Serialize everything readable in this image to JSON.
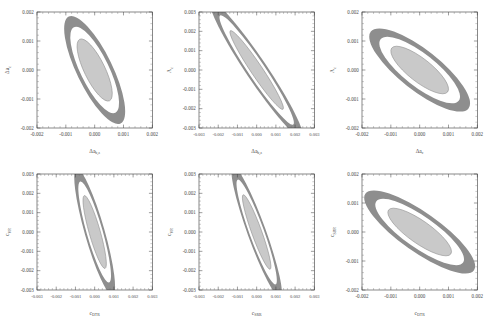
{
  "figure": {
    "type": "confidence-ellipse-grid",
    "rows": 2,
    "columns": 3,
    "background": "#ffffff",
    "contour_fill_2sigma": "#8e8e8e",
    "contour_fill_1sigma": "#c9c9c9",
    "contour_edge": "#8e8e8e",
    "axis_color": "#3a3a3a",
    "gap_fill": "#ffffff"
  },
  "chart_data": [
    {
      "id": "panel-1",
      "type": "scatter",
      "title": "",
      "xlabel": "Δa",
      "xlabel_sub": "b,z",
      "ylabel": "Δa",
      "ylabel_sub": "c",
      "xlim": [
        -0.002,
        0.002
      ],
      "ylim": [
        -0.002,
        0.002
      ],
      "xticks": [
        -0.002,
        -0.001,
        0.0,
        0.001,
        0.002
      ],
      "xticklabels": [
        "-0.002",
        "-0.001",
        "0.000",
        "0.001",
        "0.002"
      ],
      "yticks": [
        -0.002,
        -0.001,
        0.0,
        0.001,
        0.002
      ],
      "yticklabels": [
        "-0.002",
        "-0.001",
        "0.000",
        "0.001",
        "0.002"
      ],
      "grid": false,
      "legend": "none",
      "ellipses": [
        {
          "level": "2sigma",
          "cx": 0.0,
          "cy": 0.0,
          "semi_major": 0.00205,
          "semi_minor": 0.00062,
          "angle_deg": -64
        },
        {
          "level": "1sigma",
          "cx": 0.0,
          "cy": 0.0,
          "semi_major": 0.00118,
          "semi_minor": 0.00036,
          "angle_deg": -64
        }
      ],
      "correlation": -0.88
    },
    {
      "id": "panel-2",
      "type": "scatter",
      "title": "",
      "xlabel": "Δa",
      "xlabel_sub": "b,z",
      "ylabel": "Λ",
      "ylabel_sub": "c",
      "xlim": [
        -0.003,
        0.003
      ],
      "ylim": [
        -0.003,
        0.003
      ],
      "xticks": [
        -0.003,
        -0.002,
        -0.001,
        0.0,
        0.001,
        0.002,
        0.003
      ],
      "xticklabels": [
        "-0.003",
        "-0.002",
        "-0.001",
        "0.000",
        "0.001",
        "0.002",
        "0.003"
      ],
      "yticks": [
        -0.003,
        -0.002,
        -0.001,
        0.0,
        0.001,
        0.002,
        0.003
      ],
      "yticklabels": [
        "-0.003",
        "-0.002",
        "-0.001",
        "0.000",
        "0.001",
        "0.002",
        "0.003"
      ],
      "grid": false,
      "legend": "none",
      "ellipses": [
        {
          "level": "2sigma",
          "cx": 0.0,
          "cy": 0.0,
          "semi_major": 0.00425,
          "semi_minor": 0.00055,
          "angle_deg": -56
        },
        {
          "level": "1sigma",
          "cx": 0.0,
          "cy": 0.0,
          "semi_major": 0.00245,
          "semi_minor": 0.0003,
          "angle_deg": -56
        }
      ],
      "correlation": -0.97
    },
    {
      "id": "panel-3",
      "type": "scatter",
      "title": "",
      "xlabel": "Δa",
      "xlabel_sub": "c",
      "ylabel": "Λ",
      "ylabel_sub": "c",
      "xlim": [
        -0.002,
        0.002
      ],
      "ylim": [
        -0.002,
        0.002
      ],
      "xticks": [
        -0.002,
        -0.001,
        0.0,
        0.001,
        0.002
      ],
      "xticklabels": [
        "-0.002",
        "-0.001",
        "0.000",
        "0.001",
        "0.002"
      ],
      "yticks": [
        -0.002,
        -0.001,
        0.0,
        0.001,
        0.002
      ],
      "yticklabels": [
        "-0.002",
        "-0.001",
        "0.000",
        "0.001",
        "0.002"
      ],
      "grid": false,
      "legend": "none",
      "ellipses": [
        {
          "level": "2sigma",
          "cx": 0.0,
          "cy": 0.0,
          "semi_major": 0.00215,
          "semi_minor": 0.0007,
          "angle_deg": -38
        },
        {
          "level": "1sigma",
          "cx": 0.0,
          "cy": 0.0,
          "semi_major": 0.00123,
          "semi_minor": 0.0004,
          "angle_deg": -38
        }
      ],
      "correlation": -0.82
    },
    {
      "id": "panel-4",
      "type": "scatter",
      "title": "",
      "xlabel": "c",
      "xlabel_sub": "DTR",
      "ylabel": "c",
      "ylabel_sub": "VR",
      "xlim": [
        -0.003,
        0.003
      ],
      "ylim": [
        -0.003,
        0.003
      ],
      "xticks": [
        -0.003,
        -0.002,
        -0.001,
        0.0,
        0.001,
        0.002,
        0.003
      ],
      "xticklabels": [
        "-0.003",
        "-0.002",
        "-0.001",
        "0.000",
        "0.001",
        "0.002",
        "0.003"
      ],
      "yticks": [
        -0.003,
        -0.002,
        -0.001,
        0.0,
        0.001,
        0.002,
        0.003
      ],
      "yticklabels": [
        "-0.003",
        "-0.002",
        "-0.001",
        "0.000",
        "0.001",
        "0.002",
        "0.003"
      ],
      "grid": false,
      "legend": "none",
      "ellipses": [
        {
          "level": "2sigma",
          "cx": 0.0,
          "cy": 0.0,
          "semi_major": 0.0034,
          "semi_minor": 0.00052,
          "angle_deg": -74
        },
        {
          "level": "1sigma",
          "cx": 0.0,
          "cy": 0.0,
          "semi_major": 0.00196,
          "semi_minor": 0.00029,
          "angle_deg": -74
        }
      ],
      "correlation": -0.95
    },
    {
      "id": "panel-5",
      "type": "scatter",
      "title": "",
      "xlabel": "c",
      "xlabel_sub": "SRR",
      "ylabel": "c",
      "ylabel_sub": "VR",
      "xlim": [
        -0.003,
        0.003
      ],
      "ylim": [
        -0.003,
        0.003
      ],
      "xticks": [
        -0.003,
        -0.002,
        -0.001,
        0.0,
        0.001,
        0.002,
        0.003
      ],
      "xticklabels": [
        "-0.003",
        "-0.002",
        "-0.001",
        "0.000",
        "0.001",
        "0.002",
        "0.003"
      ],
      "yticks": [
        -0.003,
        -0.002,
        -0.001,
        0.0,
        0.001,
        0.002,
        0.003
      ],
      "yticklabels": [
        "-0.003",
        "-0.002",
        "-0.001",
        "0.000",
        "0.001",
        "0.002",
        "0.003"
      ],
      "grid": false,
      "legend": "none",
      "ellipses": [
        {
          "level": "2sigma",
          "cx": 0.0,
          "cy": 0.0,
          "semi_major": 0.0036,
          "semi_minor": 0.00048,
          "angle_deg": -70
        },
        {
          "level": "1sigma",
          "cx": 0.0,
          "cy": 0.0,
          "semi_major": 0.00205,
          "semi_minor": 0.00026,
          "angle_deg": -70
        }
      ],
      "correlation": -0.96
    },
    {
      "id": "panel-6",
      "type": "scatter",
      "title": "",
      "xlabel": "c",
      "xlabel_sub": "DTR",
      "ylabel": "c",
      "ylabel_sub": "SRR",
      "xlim": [
        -0.002,
        0.002
      ],
      "ylim": [
        -0.002,
        0.002
      ],
      "xticks": [
        -0.002,
        -0.001,
        0.0,
        0.001,
        0.002
      ],
      "xticklabels": [
        "-0.002",
        "-0.001",
        "0.000",
        "0.001",
        "0.002"
      ],
      "yticks": [
        -0.002,
        -0.001,
        0.0,
        0.001,
        0.002
      ],
      "yticklabels": [
        "-0.002",
        "-0.001",
        "0.000",
        "0.001",
        "0.002"
      ],
      "grid": false,
      "legend": "none",
      "ellipses": [
        {
          "level": "2sigma",
          "cx": 0.0,
          "cy": 0.0,
          "semi_major": 0.0023,
          "semi_minor": 0.00068,
          "angle_deg": -35
        },
        {
          "level": "1sigma",
          "cx": 0.0,
          "cy": 0.0,
          "semi_major": 0.00132,
          "semi_minor": 0.00039,
          "angle_deg": -35
        }
      ],
      "correlation": -0.84
    }
  ]
}
